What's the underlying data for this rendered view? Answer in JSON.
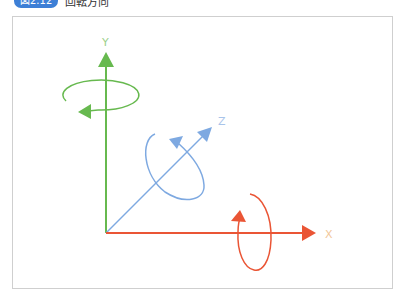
{
  "caption": {
    "badge": "図2.12",
    "title": "回転方向"
  },
  "diagram": {
    "axes": [
      {
        "name": "X",
        "label": "X",
        "color": "#ea5535"
      },
      {
        "name": "Y",
        "label": "Y",
        "color": "#67b94f"
      },
      {
        "name": "Z",
        "label": "Z",
        "color": "#7ea9e1"
      }
    ],
    "label_color_x": "#f2c79a",
    "label_color_y": "#9bd08a",
    "label_color_z": "#a9c4ea"
  }
}
